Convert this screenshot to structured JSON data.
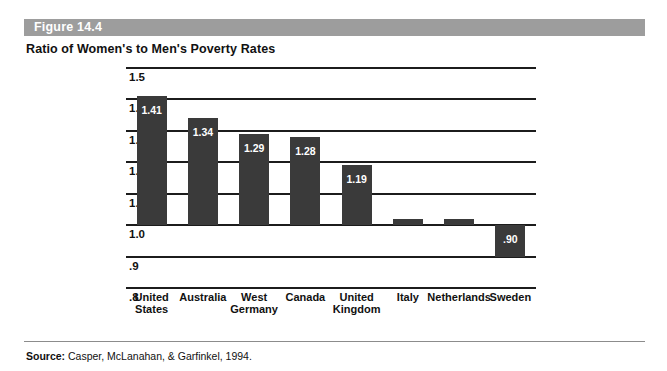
{
  "figure": {
    "number": "Figure 14.4",
    "title": "Ratio of Women's to Men's Poverty Rates",
    "header_color": "#9d9d9d"
  },
  "source": {
    "label": "Source:",
    "text": " Casper, McLanahan, & Garfinkel, 1994."
  },
  "chart_data": {
    "type": "bar",
    "title": "Ratio of Women's to Men's Poverty Rates",
    "xlabel": "",
    "ylabel": "",
    "ylim": [
      0.8,
      1.5
    ],
    "yticks": [
      "1.5",
      "1.4",
      "1.3",
      "1.2",
      "1.1",
      "1.0",
      ".9",
      ".8"
    ],
    "ytick_values": [
      1.5,
      1.4,
      1.3,
      1.2,
      1.1,
      1.0,
      0.9,
      0.8
    ],
    "grid": true,
    "legend": "none",
    "baseline": 1.0,
    "bar_color": "#3a3a3a",
    "categories": [
      "United\nStates",
      "Australia",
      "West\nGermany",
      "Canada",
      "United\nKingdom",
      "Italy",
      "Netherlands",
      "Sweden"
    ],
    "values": [
      1.41,
      1.34,
      1.29,
      1.28,
      1.19,
      1.02,
      1.02,
      0.9
    ],
    "value_labels": [
      "1.41",
      "1.34",
      "1.29",
      "1.28",
      "1.19",
      "1.02",
      "1.02",
      ".90"
    ]
  }
}
